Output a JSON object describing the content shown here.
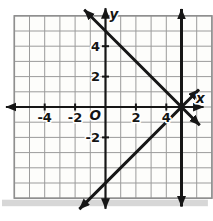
{
  "figure": {
    "background": "#ffffff",
    "paper_color": "#fdfdfb",
    "grid_color": "#9b9b9b",
    "border_color": "#8f8f8f",
    "axis_color": "#161616",
    "line_color": "#161616",
    "label_color": "#141414",
    "shadow_color": "#c6c6c6"
  },
  "chart_data": {
    "type": "line",
    "title": "",
    "xlabel": "x",
    "ylabel": "y",
    "origin_label": "O",
    "xlim": [
      -6,
      7
    ],
    "ylim": [
      -6,
      6
    ],
    "grid": true,
    "grid_step": 1,
    "x_tick_labels": [
      {
        "value": -4,
        "label": "-4"
      },
      {
        "value": -2,
        "label": "-2"
      },
      {
        "value": 2,
        "label": "2"
      },
      {
        "value": 4,
        "label": "4"
      }
    ],
    "y_tick_labels": [
      {
        "value": 4,
        "label": "4"
      },
      {
        "value": 2,
        "label": "2"
      },
      {
        "value": -2,
        "label": "-2"
      }
    ],
    "axes": {
      "x_axis_range": [
        -6.55,
        6.45
      ],
      "y_axis_range": [
        -6.7,
        6.5
      ],
      "arrows": "both"
    },
    "lines": [
      {
        "name": "line-negative-slope",
        "equation": "y = -x + 5",
        "slope": -1,
        "y_intercept": 5,
        "x_range": [
          -1.4,
          6.2
        ],
        "arrows": "both"
      },
      {
        "name": "line-positive-slope",
        "equation": "y = x - 5",
        "slope": 1,
        "y_intercept": -5,
        "x_range": [
          -1.72,
          6.15
        ],
        "arrows": "both"
      },
      {
        "name": "line-vertical",
        "equation": "x = 5",
        "vertical_at": 5,
        "y_range": [
          -6.55,
          6.45
        ],
        "arrows": "both"
      }
    ],
    "intersection_point": {
      "x": 5,
      "y": 0
    }
  }
}
